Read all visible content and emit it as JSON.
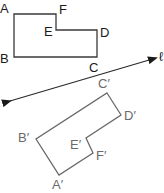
{
  "diagram": {
    "type": "reflection",
    "original_figure": {
      "vertices": [
        {
          "label": "A",
          "x": 14,
          "y": 14,
          "lx": 0,
          "ly": 2
        },
        {
          "label": "F",
          "x": 56,
          "y": 14,
          "lx": 59,
          "ly": 3
        },
        {
          "label": "E",
          "x": 56,
          "y": 30,
          "lx": 44,
          "ly": 25
        },
        {
          "label": "D",
          "x": 97,
          "y": 30,
          "lx": 100,
          "ly": 26
        },
        {
          "label": "C",
          "x": 97,
          "y": 57,
          "lx": 89,
          "ly": 61
        },
        {
          "label": "B",
          "x": 14,
          "y": 57,
          "lx": 0,
          "ly": 52
        }
      ],
      "stroke": "#3a3a3a"
    },
    "line_of_reflection": {
      "x1": 10,
      "y1": 101,
      "x2": 156,
      "y2": 58,
      "label": "ℓ",
      "stroke": "#2a2a2a"
    },
    "image_figure": {
      "vertices": [
        {
          "label": "C′",
          "x": 107,
          "y": 93,
          "lx": 98,
          "ly": 77
        },
        {
          "label": "D′",
          "x": 121,
          "y": 115,
          "lx": 124,
          "ly": 109
        },
        {
          "label": "E′",
          "x": 86,
          "y": 138,
          "lx": 70,
          "ly": 138
        },
        {
          "label": "F′",
          "x": 93,
          "y": 153,
          "lx": 96,
          "ly": 149
        },
        {
          "label": "A′",
          "x": 59,
          "y": 175,
          "lx": 52,
          "ly": 178
        },
        {
          "label": "B′",
          "x": 36,
          "y": 139,
          "lx": 18,
          "ly": 131
        }
      ],
      "stroke": "#6a6a6a"
    }
  }
}
